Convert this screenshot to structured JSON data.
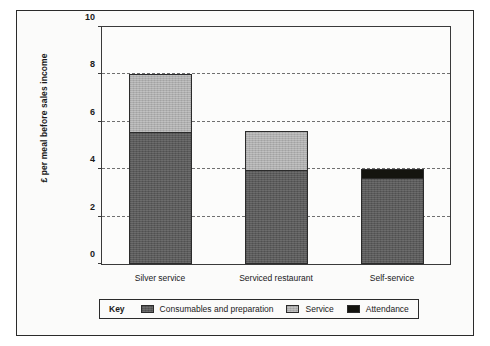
{
  "chart_data": {
    "type": "bar",
    "subtype": "stacked-bar",
    "title": "",
    "subtitle": "",
    "xlabel": "",
    "ylabel": "£ per meal before sales income",
    "categories": [
      "Silver service",
      "Serviced restaurant",
      "Self-service"
    ],
    "series": [
      {
        "name": "Consumables and preparation",
        "color": "#5b5b5b",
        "values": [
          5.6,
          4.0,
          3.65
        ]
      },
      {
        "name": "Service",
        "color": "#aeaeae",
        "values": [
          2.4,
          1.6,
          0.0
        ]
      },
      {
        "name": "Attendance",
        "color": "#14140f",
        "values": [
          0.0,
          0.0,
          0.35
        ]
      }
    ],
    "totals": [
      8.0,
      5.6,
      4.0
    ],
    "ylim": [
      0,
      10
    ],
    "yticks": [
      0,
      2,
      4,
      6,
      8,
      10
    ],
    "ytick_labels": [
      "0",
      "2",
      "4",
      "6",
      "8",
      "10"
    ],
    "gridlines": {
      "y": [
        2,
        4,
        6,
        8
      ],
      "style": "dashed",
      "axis": "y"
    },
    "grid": true,
    "legend": {
      "position": "bottom",
      "key_label": "Key",
      "entries": [
        {
          "label": "Consumables and preparation",
          "swatch": "#5b5b5b"
        },
        {
          "label": "Service",
          "swatch": "#aeaeae"
        },
        {
          "label": "Attendance",
          "swatch": "#14140f"
        }
      ]
    }
  }
}
